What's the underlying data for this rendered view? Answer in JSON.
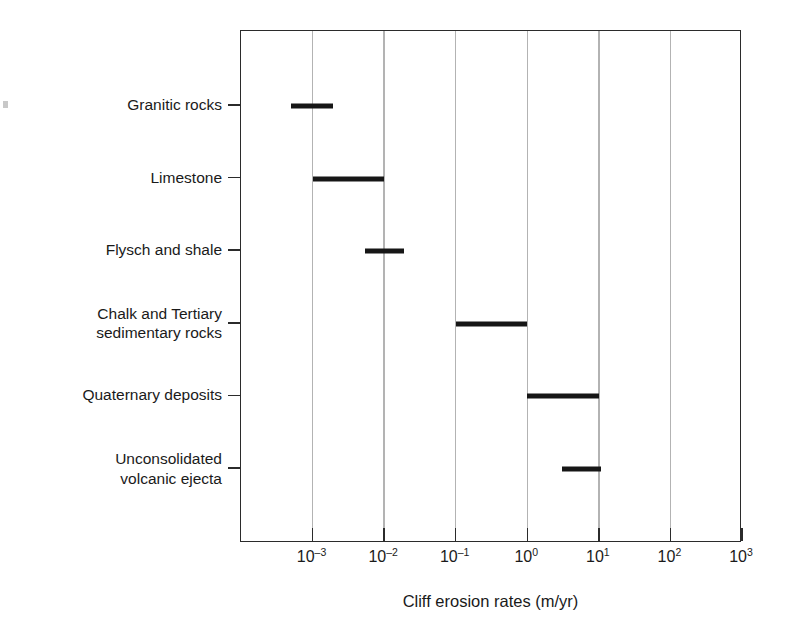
{
  "chart_data": {
    "type": "bar",
    "orientation": "horizontal",
    "title": "",
    "xlabel": "Cliff erosion rates (m/yr)",
    "ylabel": "",
    "xscale": "log",
    "xlim": [
      0.0001,
      1000
    ],
    "grid": true,
    "legend": null,
    "categories": [
      "Granitic rocks",
      "Limestone",
      "Flysch and shale",
      "Chalk and Tertiary\nsedimentary rocks",
      "Quaternary deposits",
      "Unconsolidated\nvolcanic ejecta"
    ],
    "xtick_values": [
      0.001,
      0.01,
      0.1,
      1,
      10,
      100,
      1000
    ],
    "xtick_labels": [
      {
        "mantissa": "10",
        "exponent": "–3"
      },
      {
        "mantissa": "10",
        "exponent": "–2"
      },
      {
        "mantissa": "10",
        "exponent": "–1"
      },
      {
        "mantissa": "10",
        "exponent": "0"
      },
      {
        "mantissa": "10",
        "exponent": "1"
      },
      {
        "mantissa": "10",
        "exponent": "2"
      },
      {
        "mantissa": "10",
        "exponent": "3"
      }
    ],
    "ranges": [
      {
        "category": "Granitic rocks",
        "low": 0.0005,
        "high": 0.0019
      },
      {
        "category": "Limestone",
        "low": 0.001,
        "high": 0.01
      },
      {
        "category": "Flysch and shale",
        "low": 0.0054,
        "high": 0.019
      },
      {
        "category": "Chalk and Tertiary sedimentary rocks",
        "low": 0.1,
        "high": 1.0
      },
      {
        "category": "Quaternary deposits",
        "low": 1.0,
        "high": 10.0
      },
      {
        "category": "Unconsolidated volcanic ejecta",
        "low": 3.1,
        "high": 10.6
      }
    ],
    "colors": {
      "bar": "#161616",
      "gridline": "#b3b3b3",
      "frame": "#2b2b2b",
      "text": "#1a1a1a",
      "background": "#ffffff"
    }
  }
}
